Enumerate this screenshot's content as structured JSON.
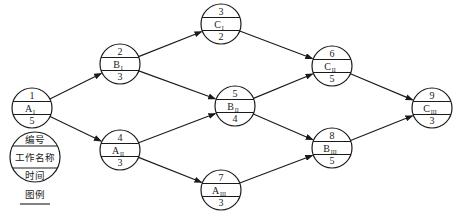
{
  "diagram": {
    "type": "activity-on-node network",
    "nodes": [
      {
        "id": "1",
        "work": "A",
        "sub": "I",
        "time": "5",
        "cx": 32,
        "cy": 108
      },
      {
        "id": "2",
        "work": "B",
        "sub": "I",
        "time": "3",
        "cx": 120,
        "cy": 64
      },
      {
        "id": "3",
        "work": "C",
        "sub": "I",
        "time": "2",
        "cx": 221,
        "cy": 24
      },
      {
        "id": "4",
        "work": "A",
        "sub": "II",
        "time": "3",
        "cx": 120,
        "cy": 150
      },
      {
        "id": "5",
        "work": "B",
        "sub": "II",
        "time": "4",
        "cx": 235,
        "cy": 106
      },
      {
        "id": "6",
        "work": "C",
        "sub": "II",
        "time": "5",
        "cx": 332,
        "cy": 66
      },
      {
        "id": "7",
        "work": "A",
        "sub": "III",
        "time": "3",
        "cx": 221,
        "cy": 190
      },
      {
        "id": "8",
        "work": "B",
        "sub": "III",
        "time": "5",
        "cx": 332,
        "cy": 148
      },
      {
        "id": "9",
        "work": "C",
        "sub": "III",
        "time": "3",
        "cx": 432,
        "cy": 108
      }
    ],
    "edges": [
      [
        "1",
        "2"
      ],
      [
        "1",
        "4"
      ],
      [
        "2",
        "3"
      ],
      [
        "2",
        "5"
      ],
      [
        "4",
        "5"
      ],
      [
        "4",
        "7"
      ],
      [
        "3",
        "6"
      ],
      [
        "5",
        "6"
      ],
      [
        "5",
        "8"
      ],
      [
        "7",
        "8"
      ],
      [
        "6",
        "9"
      ],
      [
        "8",
        "9"
      ]
    ],
    "legend": {
      "top": "编号",
      "middle": "工作名称",
      "bottom": "时间",
      "caption": "图例"
    }
  }
}
